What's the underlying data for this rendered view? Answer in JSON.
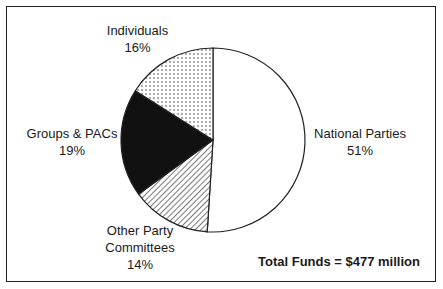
{
  "chart_data": {
    "type": "pie",
    "title": "",
    "categories": [
      "National Parties",
      "Other Party Committees",
      "Groups & PACs",
      "Individuals"
    ],
    "values": [
      51,
      14,
      19,
      16
    ],
    "unit": "%",
    "annotation": "Total Funds = $477 million",
    "legend": "none (direct labels)",
    "slices": [
      {
        "label": "National Parties",
        "value": 51,
        "display": "51%",
        "fill": "white"
      },
      {
        "label": "Other Party Committees",
        "value": 14,
        "display": "14%",
        "fill": "diagonal-hatch"
      },
      {
        "label": "Groups & PACs",
        "value": 19,
        "display": "19%",
        "fill": "black"
      },
      {
        "label": "Individuals",
        "value": 16,
        "display": "16%",
        "fill": "dotted"
      }
    ]
  },
  "labels": {
    "national": {
      "name": "National Parties",
      "pct": "51%"
    },
    "other_line1": "Other Party",
    "other_line2": "Committees",
    "other_pct": "14%",
    "groups": {
      "name": "Groups & PACs",
      "pct": "19%"
    },
    "individuals": {
      "name": "Individuals",
      "pct": "16%"
    }
  },
  "total_label": "Total Funds = $477 million"
}
